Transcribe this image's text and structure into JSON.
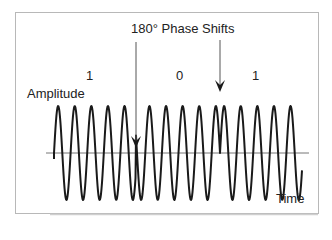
{
  "title": "180° Phase Shifts",
  "axis": {
    "y_label": "Amplitude",
    "x_label": "Time"
  },
  "bits": [
    {
      "value": "1",
      "x": 89
    },
    {
      "value": "0",
      "x": 180
    },
    {
      "value": "1",
      "x": 256
    }
  ],
  "colors": {
    "frame": "#b8b8b8",
    "wave": "#1a1a1a",
    "axis": "#777777",
    "arrow": "#1a1a1a",
    "text": "#222222"
  },
  "waveform": {
    "type": "BPSK",
    "axis_y": 153,
    "amplitude": 47,
    "period_px": 16.6,
    "start_x": 54,
    "end_x": 302,
    "phase_shift_x": [
      136,
      220
    ]
  },
  "arrows": [
    {
      "x": 136,
      "y1": 42,
      "y2": 148
    },
    {
      "x": 220,
      "y1": 40,
      "y2": 92
    }
  ]
}
